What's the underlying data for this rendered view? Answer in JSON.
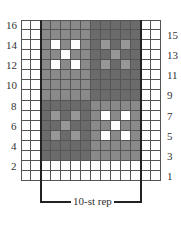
{
  "chart": {
    "columns": 14,
    "rows": 16,
    "repeat_label": "10-st rep",
    "repeat_columns": [
      3,
      12
    ],
    "left_row_numbers": [
      "16",
      "14",
      "12",
      "10",
      "8",
      "6",
      "4",
      "2"
    ],
    "right_row_numbers": [
      "15",
      "13",
      "11",
      "9",
      "7",
      "5",
      "3",
      "1"
    ],
    "colors": {
      "white": "#ffffff",
      "medium": "#8a8a8a",
      "dark": "#6b6b6b",
      "dark_dot": "#979797",
      "grid_line": "#555555",
      "rep_line": "#222222"
    },
    "grid": [
      "WWMMMMMDDDDDWW",
      "WWMMMMMDDDDDWW",
      "WWMWMWMDLDLDWW",
      "WWMMWMMDDLDDWW",
      "WWMWMWMDLDLDWW",
      "WWMMMMMDDDDDWW",
      "WWMMMMMDDDDDWW",
      "WWMMMMMDDDDDWW",
      "WWDDDDDMMMMMWW",
      "WWDLDLDMWMWMWW",
      "WWDDLDDMMWMMWW",
      "WWDLDLDMWMWMWW",
      "WWDDDDDMMMMMWW",
      "WWDDDDDMMMMMWW",
      "WWWWWWWWWWWWWW",
      "WWWWWWWWWWWWWW"
    ],
    "legend_key": {
      "W": "white",
      "M": "medium",
      "D": "dark",
      "L": "dark_dot"
    }
  }
}
